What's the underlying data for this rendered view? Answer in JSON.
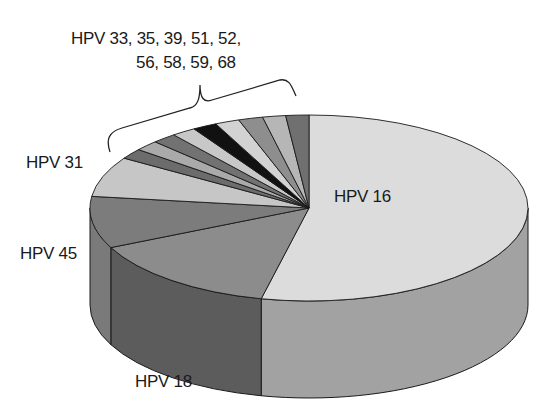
{
  "chart_data": {
    "type": "pie",
    "style": "3d",
    "title": "",
    "start_angle_deg": -90,
    "direction": "clockwise",
    "slices": [
      {
        "label": "HPV 16",
        "value": 53.5,
        "top": "#dcdcdc",
        "side": "#a2a2a2"
      },
      {
        "label": "HPV 18",
        "value": 14.5,
        "top": "#8c8c8c",
        "side": "#5c5c5c"
      },
      {
        "label": "HPV 45",
        "value": 9.0,
        "top": "#7c7c7c",
        "side": "#7a7a7a"
      },
      {
        "label": "HPV 31",
        "value": 7.0,
        "top": "#c6c6c6",
        "side": "#9a9a9a"
      },
      {
        "label": "HPV 33",
        "value": 1.8,
        "top": "#6c6c6c",
        "side": "#555555"
      },
      {
        "label": "HPV 35",
        "value": 1.8,
        "top": "#aaaaaa",
        "side": "#888888"
      },
      {
        "label": "HPV 39",
        "value": 1.8,
        "top": "#727272",
        "side": "#555555"
      },
      {
        "label": "HPV 51",
        "value": 1.8,
        "top": "#c8c8c8",
        "side": "#999999"
      },
      {
        "label": "HPV 52",
        "value": 1.8,
        "top": "#111111",
        "side": "#111111"
      },
      {
        "label": "HPV 56",
        "value": 1.8,
        "top": "#d2d2d2",
        "side": "#aaaaaa"
      },
      {
        "label": "HPV 58",
        "value": 1.8,
        "top": "#8e8e8e",
        "side": "#777777"
      },
      {
        "label": "HPV 59",
        "value": 1.7,
        "top": "#b6b6b6",
        "side": "#999999"
      },
      {
        "label": "HPV 68",
        "value": 1.7,
        "top": "#707070",
        "side": "#555555"
      }
    ],
    "geometry": {
      "cx": 309,
      "cy": 208,
      "rx": 219,
      "ry": 93,
      "depth": 97
    },
    "annotations": {
      "group_label_line1": "HPV 33, 35, 39, 51, 52,",
      "group_label_line2": "56, 58, 59, 68",
      "group_bracket_covers": [
        "HPV 33",
        "HPV 35",
        "HPV 39",
        "HPV 51",
        "HPV 52",
        "HPV 56",
        "HPV 58",
        "HPV 59",
        "HPV 68"
      ]
    },
    "legend": "none (direct labels)"
  },
  "labels": {
    "hpv16": "HPV 16",
    "hpv18": "HPV 18",
    "hpv45": "HPV 45",
    "hpv31": "HPV 31",
    "group_line1": "HPV 33, 35, 39, 51, 52,",
    "group_line2": "56, 58, 59, 68"
  }
}
